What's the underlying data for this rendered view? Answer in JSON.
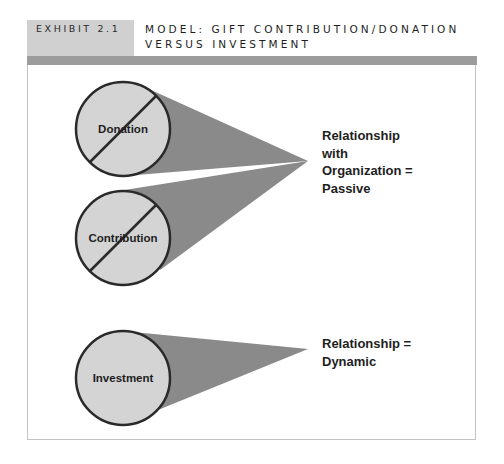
{
  "header": {
    "exhibit_label": "EXHIBIT 2.1",
    "title_line1": "MODEL: GIFT CONTRIBUTION/DONATION",
    "title_line2": "VERSUS INVESTMENT"
  },
  "diagram": {
    "circles": [
      {
        "label": "Donation",
        "crossed": true
      },
      {
        "label": "Contribution",
        "crossed": true
      },
      {
        "label": "Investment",
        "crossed": false
      }
    ],
    "outcomes": [
      {
        "lines": [
          "Relationship",
          "with",
          "Organization =",
          "Passive"
        ]
      },
      {
        "lines": [
          "Relationship =",
          "Dynamic"
        ]
      }
    ]
  },
  "colors": {
    "header_box": "#d0d0d0",
    "header_bar": "#9c9c9c",
    "circle_fill": "#d4d4d4",
    "circle_stroke": "#2a2a2a",
    "cone_fill": "#8a8a8a"
  }
}
